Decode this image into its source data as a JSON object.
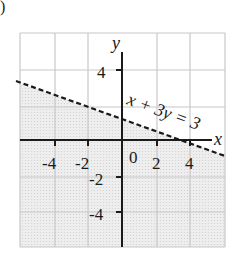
{
  "figure": {
    "corner_mark": ")",
    "axes": {
      "x_label": "x",
      "y_label": "y",
      "x_ticks": [
        "-4",
        "-2",
        "2",
        "4"
      ],
      "y_ticks": [
        "4",
        "-2",
        "-4"
      ],
      "origin_label": "0"
    },
    "boundary": {
      "equation": "x + 3y = 3",
      "style": "dashed"
    },
    "shading": "below boundary line",
    "colors": {
      "grid": "#c8c8c8",
      "axis": "#1a1a1a",
      "shade": "#e6e6e6",
      "line": "#1a1a1a"
    }
  }
}
